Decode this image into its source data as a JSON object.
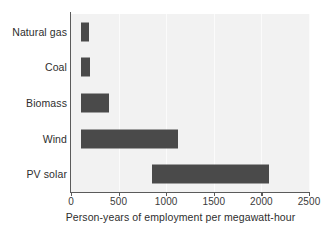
{
  "chart_data": {
    "type": "bar",
    "orientation": "horizontal",
    "title": "",
    "xlabel": "Person-years of employment per megawatt-hour",
    "ylabel": "",
    "categories": [
      "Natural gas",
      "Coal",
      "Biomass",
      "Wind",
      "PV solar"
    ],
    "ranges": [
      {
        "category": "Natural gas",
        "start": 110,
        "end": 190
      },
      {
        "category": "Coal",
        "start": 110,
        "end": 200
      },
      {
        "category": "Biomass",
        "start": 110,
        "end": 400
      },
      {
        "category": "Wind",
        "start": 110,
        "end": 1120
      },
      {
        "category": "PV solar",
        "start": 850,
        "end": 2080
      }
    ],
    "values": [
      190,
      200,
      400,
      1120,
      2080
    ],
    "xlim": [
      0,
      2500
    ],
    "xticks": [
      0,
      500,
      1000,
      1500,
      2000,
      2500
    ],
    "xtick_labels": [
      "0",
      "500",
      "1000",
      "1500",
      "2000",
      "2500"
    ],
    "grid": true,
    "legend": false,
    "bar_color": "#4a4a4a",
    "plot_background": "#f2f2f2",
    "axis_color": "#5b5b5b"
  }
}
